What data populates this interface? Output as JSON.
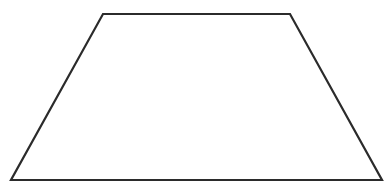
{
  "diagram": {
    "shape": "trapezoid",
    "stroke_color": "#2b2b2b",
    "fill_color": "#ffffff",
    "stroke_width": 2.2,
    "vertices": [
      {
        "name": "top-left",
        "x": 103,
        "y": 14
      },
      {
        "name": "top-right",
        "x": 290,
        "y": 14
      },
      {
        "name": "bottom-right",
        "x": 382,
        "y": 180
      },
      {
        "name": "bottom-left",
        "x": 11,
        "y": 180
      }
    ]
  }
}
